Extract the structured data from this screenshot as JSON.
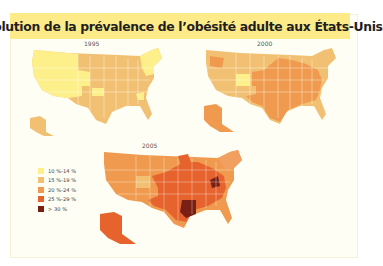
{
  "title": "Évolution de la prévalence de l’obésité adulte aux États-Unis",
  "colors": {
    "c10_14": "#fdf08a",
    "c15_19": "#f2c072",
    "c20_24": "#ef9a4f",
    "c25_29": "#e6632e",
    "c30": "#7a1f14",
    "title_bg": "#fdeb8a",
    "panel_bg": "#fffef4",
    "border": "#d6d2a4"
  },
  "maps": [
    {
      "year": "1995",
      "dominant_class": "15 %-19 %",
      "note": "West and Northeast mostly 10 %-14 %"
    },
    {
      "year": "2000",
      "dominant_class": "20 %-24 %",
      "note": "Colorado 15 %-19 %; Alaska and central/southern states 20 %-24 %"
    },
    {
      "year": "2005",
      "dominant_class": "20 %-24 %",
      "note": "Colorado 15 %-19 %; many states 25 %-29 %; Mississippi, Louisiana, West Virginia > 30 %"
    }
  ],
  "legend": {
    "items": [
      {
        "label": "10 %-14 %",
        "color": "#fdf08a"
      },
      {
        "label": "15 %-19 %",
        "color": "#f2c072"
      },
      {
        "label": "20 %-24 %",
        "color": "#ef9a4f"
      },
      {
        "label": "25 %-29 %",
        "color": "#e6632e"
      },
      {
        "label": "> 30 %",
        "color": "#7a1f14"
      }
    ]
  }
}
